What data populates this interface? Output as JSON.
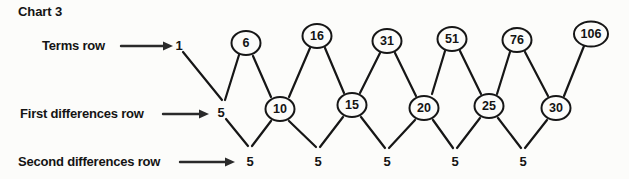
{
  "title": "Chart 3",
  "colors": {
    "ink": "#161616",
    "background": "#fcfcfa"
  },
  "rows": {
    "terms": {
      "label": "Terms row",
      "values": [
        "1",
        "6",
        "16",
        "31",
        "51",
        "76",
        "106"
      ],
      "circled": [
        false,
        true,
        true,
        true,
        true,
        true,
        true
      ]
    },
    "first_differences": {
      "label": "First differences row",
      "values": [
        "5",
        "10",
        "15",
        "20",
        "25",
        "30"
      ],
      "circled": [
        false,
        true,
        true,
        true,
        true,
        true
      ]
    },
    "second_differences": {
      "label": "Second differences row",
      "values": [
        "5",
        "5",
        "5",
        "5",
        "5"
      ],
      "circled": [
        false,
        false,
        false,
        false,
        false
      ]
    }
  }
}
